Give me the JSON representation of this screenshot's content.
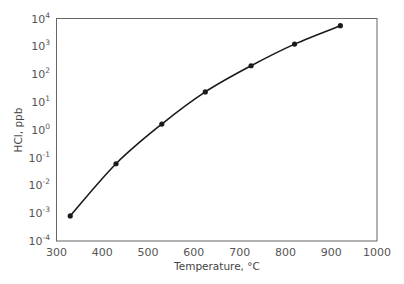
{
  "chart_data": {
    "type": "line",
    "title": "",
    "xlabel": "Temperature, °C",
    "ylabel": "HCl, ppb",
    "xlim": [
      300,
      1000
    ],
    "ylim": [
      0.0001,
      10000
    ],
    "yscale": "log",
    "grid": false,
    "legend": null,
    "x_ticks": [
      300,
      400,
      500,
      600,
      700,
      800,
      900,
      1000
    ],
    "y_ticks": [
      {
        "base": "10",
        "exp": "4"
      },
      {
        "base": "10",
        "exp": "3"
      },
      {
        "base": "10",
        "exp": "2"
      },
      {
        "base": "10",
        "exp": "1"
      },
      {
        "base": "10",
        "exp": "0"
      },
      {
        "base": "10",
        "exp": "-1"
      },
      {
        "base": "10",
        "exp": "-2"
      },
      {
        "base": "10",
        "exp": "-3"
      },
      {
        "base": "10",
        "exp": "-4"
      }
    ],
    "series": [
      {
        "name": "HCl",
        "x": [
          330,
          430,
          530,
          625,
          725,
          820,
          920
        ],
        "y": [
          0.0008,
          0.06,
          1.6,
          23,
          200,
          1200,
          5500
        ],
        "marker": "circle",
        "color": "#1a1a1a"
      }
    ]
  },
  "colors": {
    "frame": "#555555",
    "line": "#1a1a1a",
    "text": "#555555"
  }
}
